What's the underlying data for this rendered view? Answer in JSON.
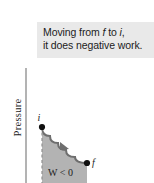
{
  "figure": {
    "name": "pressure-volume-negative-work-diagram",
    "background_color": "#ffffff"
  },
  "caption": {
    "background_color": "#e9e9e9",
    "line1_prefix": "Moving from ",
    "line1_italic_1": "f",
    "line1_middle": " to ",
    "line1_italic_2": "i",
    "line1_suffix": ",",
    "line2": "it does negative work."
  },
  "axes": {
    "y_label": "Pressure",
    "axis_color": "#8a8a8a"
  },
  "chart_data": {
    "type": "line",
    "title": "",
    "xlabel": "",
    "ylabel": "Pressure",
    "grid": false,
    "legend_position": "none",
    "curve_color": "#6e6e6e",
    "fill_color": "#b3b3b3",
    "point_color": "#111111",
    "series": [
      {
        "name": "isotherm",
        "points": [
          {
            "x": 42,
            "y": 127
          },
          {
            "x": 50,
            "y": 136
          },
          {
            "x": 58,
            "y": 143
          },
          {
            "x": 66,
            "y": 150
          },
          {
            "x": 75,
            "y": 157
          },
          {
            "x": 87,
            "y": 163
          }
        ]
      }
    ],
    "annotations": [
      {
        "name": "point-i",
        "label": "i",
        "x": 42,
        "y": 127,
        "label_x": 39,
        "label_y": 119
      },
      {
        "name": "point-f",
        "label": "f",
        "x": 87,
        "y": 163,
        "label_x": 92,
        "label_y": 163
      },
      {
        "name": "work-region",
        "label": "W < 0",
        "x": 57,
        "y": 172
      },
      {
        "name": "process-direction-arrow",
        "label": "",
        "x": 64,
        "y": 147
      }
    ]
  }
}
